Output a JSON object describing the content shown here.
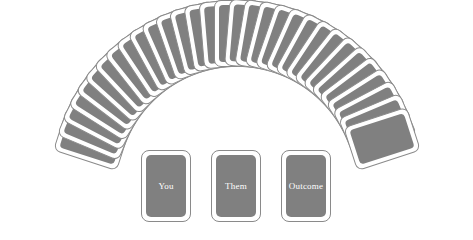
{
  "scene": {
    "title": "Card fan layout",
    "background_color": "#ffffff",
    "card_face_color": "#808080",
    "card_border_color": "#8a8a8a",
    "card_back_color": "#ffffff",
    "label_color": "#ffffff"
  },
  "fan": {
    "name": "fanned-card-deck",
    "card_count": 31,
    "arc_start_angle": -72,
    "arc_end_angle": 72,
    "pivot_y": 186,
    "card_width": 46,
    "card_height": 67
  },
  "play_cards": [
    {
      "id": "you",
      "label": "You"
    },
    {
      "id": "them",
      "label": "Them"
    },
    {
      "id": "outcome",
      "label": "Outcome"
    }
  ]
}
